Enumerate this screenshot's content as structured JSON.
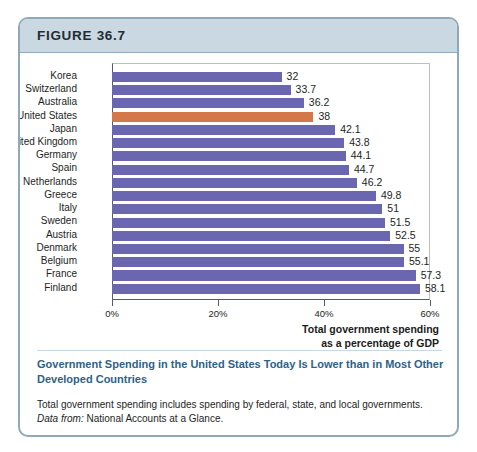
{
  "figure": {
    "number_label": "FIGURE 36.7",
    "header_bg": "#c9d8e1",
    "border_color": "#8fa9bb"
  },
  "caption": {
    "headline": "Government Spending in the United States Today Is Lower than in Most Other Developed Countries",
    "body": "Total government spending includes spending by federal, state, and local governments.",
    "source_label": "Data from:",
    "source_text": "National Accounts at a Glance.",
    "headline_color": "#2e6287"
  },
  "chart_data": {
    "type": "bar",
    "orientation": "horizontal",
    "title": "",
    "xlabel": "Total government spending as a percentage of GDP",
    "ylabel": "",
    "xlim": [
      0,
      60
    ],
    "grid": false,
    "legend": null,
    "bar_color": "#6b66b0",
    "highlight_color": "#d4784c",
    "highlight_category": "United States",
    "xticks": [
      "0%",
      "20%",
      "40%",
      "60%"
    ],
    "xtick_values": [
      0,
      20,
      40,
      60
    ],
    "axis_title_line1": "Total government spending",
    "axis_title_line2": "as a percentage of GDP",
    "categories": [
      "Korea",
      "Switzerland",
      "Australia",
      "United States",
      "Japan",
      "United Kingdom",
      "Germany",
      "Spain",
      "Netherlands",
      "Greece",
      "Italy",
      "Sweden",
      "Austria",
      "Denmark",
      "Belgium",
      "France",
      "Finland"
    ],
    "values": [
      32,
      33.7,
      36.2,
      38,
      42.1,
      43.8,
      44.1,
      44.7,
      46.2,
      49.8,
      51,
      51.5,
      52.5,
      55,
      55.1,
      57.3,
      58.1
    ],
    "value_labels": [
      "32",
      "33.7",
      "36.2",
      "38",
      "42.1",
      "43.8",
      "44.1",
      "44.7",
      "46.2",
      "49.8",
      "51",
      "51.5",
      "52.5",
      "55",
      "55.1",
      "57.3",
      "58.1"
    ]
  }
}
